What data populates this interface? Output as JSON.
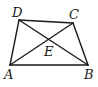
{
  "diagram": {
    "type": "quadrilateral-with-diagonals",
    "points": {
      "A": {
        "label": "A",
        "x": 10,
        "y": 65
      },
      "B": {
        "label": "B",
        "x": 88,
        "y": 65
      },
      "C": {
        "label": "C",
        "x": 73,
        "y": 23
      },
      "D": {
        "label": "D",
        "x": 19,
        "y": 20
      },
      "E": {
        "label": "E",
        "x": 50,
        "y": 41
      }
    },
    "edges": [
      [
        "A",
        "B"
      ],
      [
        "B",
        "C"
      ],
      [
        "C",
        "D"
      ],
      [
        "D",
        "A"
      ],
      [
        "A",
        "C"
      ],
      [
        "B",
        "D"
      ]
    ],
    "labels": {
      "A": "A",
      "B": "B",
      "C": "C",
      "D": "D",
      "E": "E"
    }
  }
}
